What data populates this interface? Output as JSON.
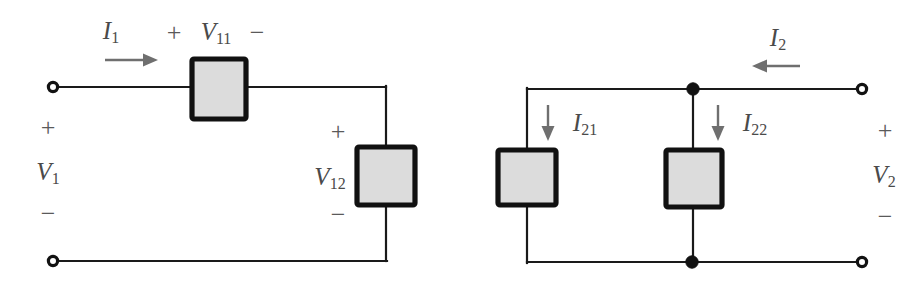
{
  "figure": {
    "type": "schematic",
    "colors": {
      "wire": "#1a1a1a",
      "resistor_fill": "#dcdcdc",
      "resistor_border": "#111111",
      "arrow": "#6f6f6f",
      "label_text": "#4a4a4a",
      "background": "#ffffff"
    }
  },
  "left_circuit": {
    "name": "port-1-series-network",
    "current_label": "I",
    "current_sub": "1",
    "current_direction": "right",
    "port_voltage": {
      "label": "V",
      "sub": "1"
    },
    "port_polarity_top": "+",
    "port_polarity_bottom": "−",
    "elements": [
      {
        "name": "element-v11",
        "voltage_label": "V",
        "voltage_sub": "11",
        "polarity_left": "+",
        "polarity_right": "−",
        "orientation": "horizontal"
      },
      {
        "name": "element-v12",
        "voltage_label": "V",
        "voltage_sub": "12",
        "polarity_top": "+",
        "polarity_bottom": "−",
        "orientation": "vertical"
      }
    ],
    "terminals": [
      {
        "name": "terminal-1-top"
      },
      {
        "name": "terminal-1-bottom"
      }
    ]
  },
  "right_circuit": {
    "name": "port-2-parallel-network",
    "current_label": "I",
    "current_sub": "2",
    "current_direction": "left",
    "port_voltage": {
      "label": "V",
      "sub": "2"
    },
    "port_polarity_top": "+",
    "port_polarity_bottom": "−",
    "branches": [
      {
        "name": "branch-i21",
        "current_label": "I",
        "current_sub": "21",
        "current_direction": "down"
      },
      {
        "name": "branch-i22",
        "current_label": "I",
        "current_sub": "22",
        "current_direction": "down"
      }
    ],
    "nodes": [
      {
        "name": "node-top-junction"
      },
      {
        "name": "node-bottom-junction"
      }
    ],
    "terminals": [
      {
        "name": "terminal-2-top"
      },
      {
        "name": "terminal-2-bottom"
      }
    ]
  }
}
